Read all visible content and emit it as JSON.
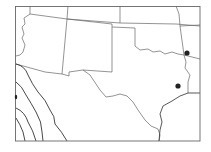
{
  "map": {
    "type": "outline map",
    "region": "South-central United States",
    "background": "#ffffff",
    "line_color": "#555555",
    "frame_color": "#666666",
    "contour_color": "#333333",
    "marker_color": "#222222",
    "markers": [
      {
        "id": "marker-1",
        "x": 187,
        "y": 53
      },
      {
        "id": "marker-2",
        "x": 178,
        "y": 86
      },
      {
        "id": "marker-3",
        "x": 16,
        "y": 97
      }
    ]
  }
}
